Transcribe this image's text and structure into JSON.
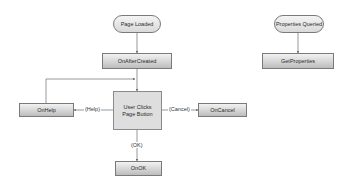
{
  "diagram": {
    "nodes": {
      "page_loaded": "Page Loaded",
      "on_after_created": "OnAfterCreated",
      "user_clicks": "User Clicks Page Button",
      "on_help": "OnHelp",
      "on_cancel": "OnCancel",
      "on_ok": "OnOK",
      "properties_queried": "Properties Queried",
      "get_properties": "GetProperties"
    },
    "edge_labels": {
      "help": "(Help)",
      "cancel": "(Cancel)",
      "ok": "(OK)"
    },
    "colors": {
      "border": "#7a7a7a",
      "line": "#6e6e6e",
      "fill_light": "#f2f2f2",
      "fill_dark": "#bdbdbd"
    }
  }
}
